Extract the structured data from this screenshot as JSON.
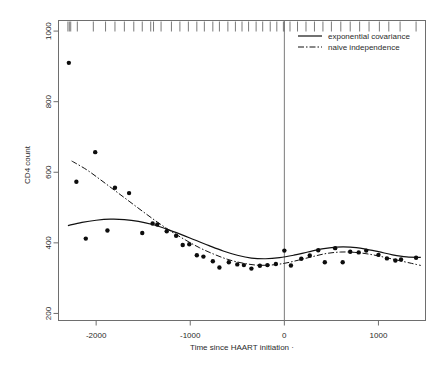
{
  "chart_data": {
    "type": "scatter",
    "title": "",
    "xlabel": "Time since HAART initiation ·",
    "ylabel": "CD4 count",
    "xlim": [
      -2400,
      1500
    ],
    "ylim": [
      180,
      1030
    ],
    "xticks": [
      -2000,
      -1000,
      0,
      1000
    ],
    "xtick_labels": [
      "-2000",
      "-1000",
      "0",
      "1000"
    ],
    "yticks": [
      200,
      400,
      600,
      800,
      1000
    ],
    "ytick_labels": [
      "200",
      "400",
      "600",
      "800",
      "1000"
    ],
    "grid": false,
    "legend_position": "top-right",
    "legend": [
      {
        "label": "exponential covariance",
        "style": "solid"
      },
      {
        "label": "naive independence",
        "style": "dashdot"
      }
    ],
    "reference_line_x": 0,
    "points": [
      {
        "x": -2290,
        "y": 910
      },
      {
        "x": -2210,
        "y": 573
      },
      {
        "x": -2110,
        "y": 412
      },
      {
        "x": -2010,
        "y": 657
      },
      {
        "x": -1880,
        "y": 435
      },
      {
        "x": -1800,
        "y": 556
      },
      {
        "x": -1650,
        "y": 541
      },
      {
        "x": -1510,
        "y": 428
      },
      {
        "x": -1400,
        "y": 455
      },
      {
        "x": -1350,
        "y": 452
      },
      {
        "x": -1250,
        "y": 433
      },
      {
        "x": -1150,
        "y": 420
      },
      {
        "x": -1080,
        "y": 394
      },
      {
        "x": -1010,
        "y": 396
      },
      {
        "x": -930,
        "y": 365
      },
      {
        "x": -860,
        "y": 361
      },
      {
        "x": -760,
        "y": 348
      },
      {
        "x": -690,
        "y": 330
      },
      {
        "x": -590,
        "y": 345
      },
      {
        "x": -500,
        "y": 339
      },
      {
        "x": -430,
        "y": 337
      },
      {
        "x": -350,
        "y": 327
      },
      {
        "x": -260,
        "y": 335
      },
      {
        "x": -180,
        "y": 337
      },
      {
        "x": -90,
        "y": 340
      },
      {
        "x": 0,
        "y": 378
      },
      {
        "x": 70,
        "y": 336
      },
      {
        "x": 180,
        "y": 355
      },
      {
        "x": 270,
        "y": 364
      },
      {
        "x": 360,
        "y": 379
      },
      {
        "x": 430,
        "y": 345
      },
      {
        "x": 540,
        "y": 385
      },
      {
        "x": 620,
        "y": 345
      },
      {
        "x": 700,
        "y": 375
      },
      {
        "x": 790,
        "y": 373
      },
      {
        "x": 870,
        "y": 378
      },
      {
        "x": 1000,
        "y": 366
      },
      {
        "x": 1090,
        "y": 356
      },
      {
        "x": 1180,
        "y": 350
      },
      {
        "x": 1240,
        "y": 353
      },
      {
        "x": 1400,
        "y": 358
      }
    ],
    "series": [
      {
        "name": "exponential covariance",
        "style": "solid",
        "x": [
          -2300,
          -2150,
          -2000,
          -1850,
          -1700,
          -1550,
          -1400,
          -1250,
          -1100,
          -950,
          -800,
          -650,
          -500,
          -350,
          -200,
          -50,
          100,
          250,
          400,
          550,
          700,
          850,
          1000,
          1150,
          1300,
          1450
        ],
        "y": [
          449,
          458,
          464,
          467,
          466,
          461,
          452,
          439,
          424,
          408,
          392,
          377,
          365,
          357,
          355,
          358,
          365,
          374,
          383,
          388,
          388,
          383,
          375,
          366,
          360,
          359
        ]
      },
      {
        "name": "naive independence",
        "style": "dashdot",
        "x": [
          -2260,
          -2100,
          -1950,
          -1800,
          -1650,
          -1500,
          -1350,
          -1200,
          -1050,
          -900,
          -750,
          -600,
          -450,
          -300,
          -150,
          0,
          150,
          300,
          450,
          600,
          750,
          900,
          1050,
          1200,
          1350,
          1450
        ],
        "y": [
          632,
          607,
          578,
          548,
          518,
          488,
          459,
          432,
          408,
          386,
          368,
          353,
          343,
          337,
          337,
          342,
          351,
          361,
          370,
          374,
          373,
          368,
          360,
          351,
          342,
          336
        ]
      }
    ],
    "rug_x": [
      -2300,
      -2285,
      -2270,
      -2200,
      -2030,
      -1900,
      -1800,
      -1700,
      -1600,
      -1510,
      -1420,
      -1390,
      -1310,
      -1200,
      -1110,
      -1020,
      -930,
      -850,
      -760,
      -690,
      -600,
      -520,
      -450,
      -380,
      -300,
      -230,
      -150,
      -80,
      -10,
      0,
      60,
      140,
      230,
      320,
      410,
      500,
      600,
      700,
      800,
      900,
      1010,
      1110,
      1230,
      1400
    ]
  }
}
